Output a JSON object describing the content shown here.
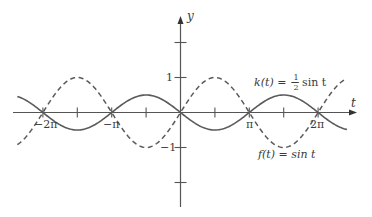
{
  "chart_data": {
    "type": "line",
    "title": "",
    "xlabel": "t",
    "ylabel": "y",
    "xlim": [
      -7.55,
      7.7
    ],
    "ylim": [
      -2.7,
      3.3
    ],
    "grid": false,
    "x_ticks": [
      {
        "value": -6.2832,
        "label": "−2π"
      },
      {
        "value": -4.7124,
        "label": ""
      },
      {
        "value": -3.1416,
        "label": "−π"
      },
      {
        "value": -1.5708,
        "label": ""
      },
      {
        "value": 1.5708,
        "label": ""
      },
      {
        "value": 3.1416,
        "label": "π"
      },
      {
        "value": 4.7124,
        "label": ""
      },
      {
        "value": 6.2832,
        "label": "2π"
      }
    ],
    "y_ticks": [
      {
        "value": 2,
        "label": ""
      },
      {
        "value": 1,
        "label": "1"
      },
      {
        "value": -1,
        "label": "−1"
      },
      {
        "value": -2,
        "label": ""
      }
    ],
    "series": [
      {
        "name": "f(t) = sin t",
        "style": "dashed",
        "color": "#555555",
        "amplitude": 1,
        "t_range": [
          -7.45,
          7.6
        ],
        "expression": "sin t",
        "sample_points": [
          {
            "t": -6.2832,
            "y": 0
          },
          {
            "t": -4.7124,
            "y": 1
          },
          {
            "t": -3.1416,
            "y": 0
          },
          {
            "t": -1.5708,
            "y": -1
          },
          {
            "t": 0,
            "y": 0
          },
          {
            "t": 1.5708,
            "y": 1
          },
          {
            "t": 3.1416,
            "y": 0
          },
          {
            "t": 4.7124,
            "y": -1
          },
          {
            "t": 6.2832,
            "y": 0
          }
        ]
      },
      {
        "name": "k(t) = −½ sin t",
        "style": "solid",
        "color": "#555555",
        "amplitude": 0.5,
        "t_range": [
          -7.45,
          7.6
        ],
        "expression": "-0.5 sin t",
        "sample_points": [
          {
            "t": -6.2832,
            "y": 0
          },
          {
            "t": -4.7124,
            "y": -0.5
          },
          {
            "t": -3.1416,
            "y": 0
          },
          {
            "t": -1.5708,
            "y": 0.5
          },
          {
            "t": 0,
            "y": 0
          },
          {
            "t": 1.5708,
            "y": -0.5
          },
          {
            "t": 3.1416,
            "y": 0
          },
          {
            "t": 4.7124,
            "y": 0.5
          },
          {
            "t": 6.2832,
            "y": 0
          }
        ]
      }
    ],
    "annotations": [
      {
        "text_parts": [
          "k(t) = −",
          "1",
          "2",
          " sin t"
        ],
        "near_series": "k(t)"
      },
      {
        "text": "f(t) = sin t",
        "near_series": "f(t)"
      }
    ]
  },
  "labels": {
    "y_axis": "y",
    "x_axis": "t",
    "tick_neg_2pi": "−2π",
    "tick_neg_pi": "−π",
    "tick_pi": "π",
    "tick_2pi": "2π",
    "tick_y_1": "1",
    "tick_y_neg1": "−1",
    "k_label_prefix": "k(t) = −",
    "k_label_num": "1",
    "k_label_den": "2",
    "k_label_suffix": "sin t",
    "f_label": "f(t) = sin t"
  },
  "layout": {
    "origin_x": 180.5,
    "origin_y": 112.5,
    "px_per_rad": 21.9,
    "px_per_unit_y": 35
  }
}
